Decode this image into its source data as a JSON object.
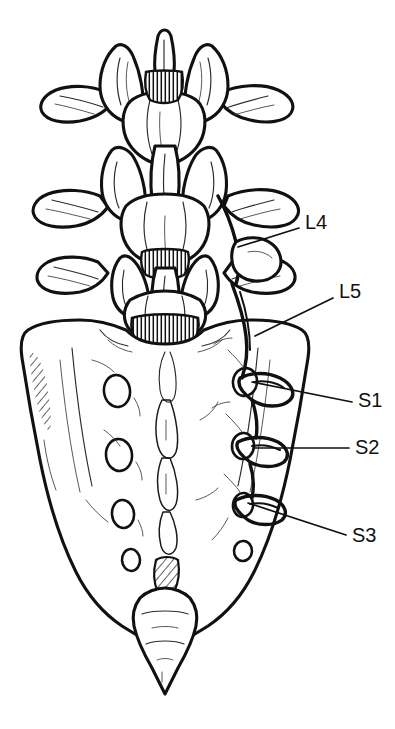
{
  "figure": {
    "view": "posterior",
    "style": "ink line art",
    "background_color": "#ffffff",
    "line_color": "#111111"
  },
  "labels": [
    {
      "id": "l4",
      "text": "L4",
      "name": "label-l4",
      "text_x": 305,
      "text_y": 224,
      "leader": {
        "x1": 299,
        "y1": 228,
        "x2": 238,
        "y2": 247
      }
    },
    {
      "id": "l5",
      "text": "L5",
      "name": "label-l5",
      "text_x": 339,
      "text_y": 293,
      "leader": {
        "x1": 333,
        "y1": 298,
        "x2": 255,
        "y2": 336
      }
    },
    {
      "id": "s1",
      "text": "S1",
      "name": "label-s1",
      "text_x": 358,
      "text_y": 402,
      "leader": {
        "x1": 352,
        "y1": 402,
        "x2": 252,
        "y2": 382
      }
    },
    {
      "id": "s2",
      "text": "S2",
      "name": "label-s2",
      "text_x": 355,
      "text_y": 449,
      "leader": {
        "x1": 349,
        "y1": 448,
        "x2": 253,
        "y2": 448
      }
    },
    {
      "id": "s3",
      "text": "S3",
      "name": "label-s3",
      "text_x": 352,
      "text_y": 537,
      "leader": {
        "x1": 346,
        "y1": 535,
        "x2": 248,
        "y2": 503
      }
    }
  ],
  "anatomy": {
    "vertebrae": [
      {
        "name": "upper-lumbar-vertebra",
        "level": "L3"
      },
      {
        "name": "middle-lumbar-vertebra",
        "level": "L4"
      },
      {
        "name": "lower-lumbar-vertebra",
        "level": "L5"
      }
    ],
    "sacrum": {
      "name": "sacrum",
      "foramina_pairs": 4,
      "left_foramina": [
        {
          "cx": 117,
          "cy": 391,
          "rx": 13,
          "ry": 16
        },
        {
          "cx": 119,
          "cy": 455,
          "rx": 13,
          "ry": 16
        },
        {
          "cx": 123,
          "cy": 514,
          "rx": 11,
          "ry": 14
        },
        {
          "cx": 131,
          "cy": 560,
          "rx": 9,
          "ry": 11
        }
      ],
      "right_foramina": [
        {
          "cx": 245,
          "cy": 382,
          "rx": 12,
          "ry": 14
        },
        {
          "cx": 243,
          "cy": 446,
          "rx": 11,
          "ry": 13
        },
        {
          "cx": 243,
          "cy": 505,
          "rx": 10,
          "ry": 12
        },
        {
          "cx": 243,
          "cy": 551,
          "rx": 9,
          "ry": 10
        }
      ]
    },
    "coccyx": {
      "name": "coccyx",
      "segments": 3
    },
    "nerve_roots": [
      {
        "name": "nerve-root-l4"
      },
      {
        "name": "nerve-root-l5"
      },
      {
        "name": "nerve-root-s1"
      },
      {
        "name": "nerve-root-s2"
      },
      {
        "name": "nerve-root-s3"
      }
    ]
  }
}
